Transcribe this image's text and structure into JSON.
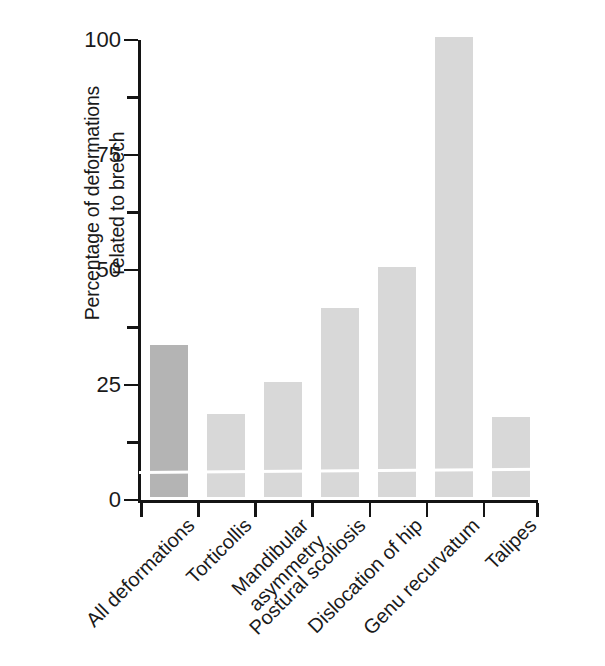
{
  "chart_data": {
    "type": "bar",
    "title": "",
    "xlabel": "",
    "ylabel": "Percentage of deformations related to breech",
    "ylabel_lines": [
      "Percentage of deformations",
      "related to breech"
    ],
    "categories": [
      "All deformations",
      "Torticollis",
      "Mandibular asymmetry",
      "Postural scoliosis",
      "Dislocation of hip",
      "Genu recurvatum",
      "Talipes"
    ],
    "category_lines": [
      [
        "All deformations"
      ],
      [
        "Torticollis"
      ],
      [
        "Mandibular",
        "asymmetry"
      ],
      [
        "Postural scoliosis"
      ],
      [
        "Dislocation of hip"
      ],
      [
        "Genu recurvatum"
      ],
      [
        "Talipes"
      ]
    ],
    "values": [
      33,
      18,
      25,
      41,
      50,
      100,
      17.5
    ],
    "bar_colors": [
      "#b4b4b4",
      "#d8d8d8",
      "#d8d8d8",
      "#d8d8d8",
      "#d8d8d8",
      "#d8d8d8",
      "#d8d8d8"
    ],
    "highlight_index": 0,
    "ylim": [
      0,
      100
    ],
    "ytick_labels": [
      "0",
      "25",
      "50",
      "75",
      "100"
    ],
    "ytick_values": [
      0,
      25,
      50,
      75,
      100
    ],
    "yminor_values": [
      12.5,
      37.5,
      62.5,
      87.5
    ],
    "grid": false,
    "legend": null,
    "axis_color": "#141414"
  },
  "figure": {
    "background": "#ffffff"
  }
}
